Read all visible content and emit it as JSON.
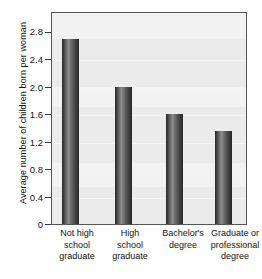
{
  "chart_data": {
    "type": "bar",
    "title": "",
    "subtitle": "",
    "xlabel": "",
    "ylabel": "Average number of children born per woman",
    "categories": [
      "Not high school graduate",
      "High school graduate",
      "Bachelor's degree",
      "Graduate or professional degree"
    ],
    "category_lines": [
      [
        "Not high",
        "school",
        "graduate"
      ],
      [
        "High",
        "school",
        "graduate"
      ],
      [
        "Bachelor's",
        "degree"
      ],
      [
        "Graduate or",
        "professional",
        "degree"
      ]
    ],
    "values": [
      2.7,
      2.0,
      1.6,
      1.35
    ],
    "ylim": [
      0,
      3.0
    ],
    "yticks": [
      0,
      0.4,
      0.8,
      1.2,
      1.6,
      2.0,
      2.4,
      2.8
    ],
    "ytick_labels": [
      "0",
      "0.4",
      "0.8",
      "1.2",
      "1.6",
      "2.0",
      "2.4",
      "2.8"
    ],
    "grid": true,
    "legend": "none",
    "colors": {
      "bar_dark": "#2b2b2b",
      "bar_highlight": "#8c8c8c",
      "plot_background": "#ebebeb",
      "frame": "#555555",
      "gridline": "#f4f4f4",
      "text": "#141414"
    }
  }
}
